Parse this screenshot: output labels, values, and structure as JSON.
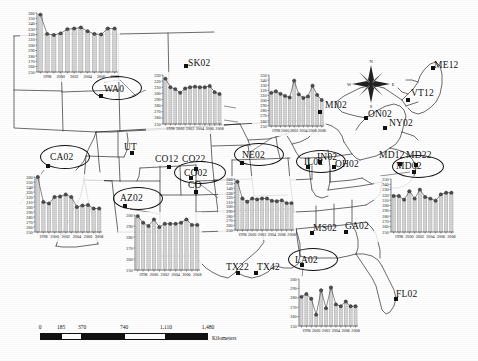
{
  "figure": {
    "kind": "map-with-inset-timeseries",
    "region": "North America (conterminous United States and southern Canada)",
    "axis": {
      "y_ticks": [
        "360",
        "350",
        "340",
        "330",
        "320",
        "310",
        "300",
        "290",
        "280",
        "270",
        "260",
        "250"
      ],
      "y_min": 250,
      "y_max": 360,
      "x_ticks": [
        "1998",
        "2000",
        "2002",
        "2004",
        "2006",
        "2008"
      ],
      "x_min": 1997,
      "x_max": 2009
    },
    "colors": {
      "bar_fill": "#d4d4d4",
      "bar_stroke": "#9a9a9a",
      "marker": "#4d4d4d",
      "line": "#3a3a3a",
      "map_line": "#2b2b2b",
      "text": "#111111"
    }
  },
  "compass": {
    "name": "compass-rose",
    "north": "N",
    "east": "E",
    "south": "S",
    "west": "W"
  },
  "scale_bar": {
    "ticks": [
      "0",
      "185",
      "370",
      "740",
      "1,110",
      "1,480"
    ],
    "unit_label": "Kilometers"
  },
  "site_labels": [
    {
      "id": "WA0",
      "text": "WA0",
      "x": 104,
      "y": 84,
      "dot_x": 99,
      "dot_y": 94,
      "circled": true,
      "ellipse": {
        "x": 92,
        "y": 76,
        "w": 48,
        "h": 22
      }
    },
    {
      "id": "SK02",
      "text": "SK02",
      "x": 188,
      "y": 58,
      "dot_x": 184,
      "dot_y": 64,
      "circled": false
    },
    {
      "id": "CA02",
      "text": "CA02",
      "x": 50,
      "y": 152,
      "dot_x": 46,
      "dot_y": 164,
      "circled": true,
      "ellipse": {
        "x": 40,
        "y": 145,
        "w": 48,
        "h": 22
      }
    },
    {
      "id": "UT",
      "text": "UT",
      "x": 124,
      "y": 142,
      "dot_x": 130,
      "dot_y": 151,
      "circled": false
    },
    {
      "id": "CO12",
      "text": "CO12",
      "x": 155,
      "y": 154,
      "dot_x": 167,
      "dot_y": 165,
      "circled": false
    },
    {
      "id": "CO22",
      "text": "CO22",
      "x": 182,
      "y": 154,
      "dot_x": 194,
      "dot_y": 167,
      "circled": false
    },
    {
      "id": "CO02",
      "text": "CO02",
      "x": 184,
      "y": 168,
      "dot_x": 189,
      "dot_y": 176,
      "circled": true,
      "ellipse": {
        "x": 174,
        "y": 161,
        "w": 50,
        "h": 21
      }
    },
    {
      "id": "CO",
      "text": "CO",
      "x": 188,
      "y": 180,
      "dot_x": 194,
      "dot_y": 190,
      "circled": false
    },
    {
      "id": "AZ02",
      "text": "AZ02",
      "x": 120,
      "y": 193,
      "dot_x": 123,
      "dot_y": 204,
      "circled": true,
      "ellipse": {
        "x": 113,
        "y": 187,
        "w": 48,
        "h": 21
      }
    },
    {
      "id": "NE02",
      "text": "NE02",
      "x": 242,
      "y": 150,
      "dot_x": 240,
      "dot_y": 161,
      "circled": true,
      "ellipse": {
        "x": 234,
        "y": 143,
        "w": 48,
        "h": 21
      }
    },
    {
      "id": "MI02",
      "text": "MI02",
      "x": 325,
      "y": 100,
      "dot_x": 318,
      "dot_y": 110,
      "circled": false
    },
    {
      "id": "ON02",
      "text": "ON02",
      "x": 368,
      "y": 109,
      "dot_x": 364,
      "dot_y": 116,
      "circled": false
    },
    {
      "id": "NY02",
      "text": "NY02",
      "x": 389,
      "y": 118,
      "dot_x": 383,
      "dot_y": 126,
      "circled": false
    },
    {
      "id": "VT12",
      "text": "VT12",
      "x": 411,
      "y": 88,
      "dot_x": 406,
      "dot_y": 98,
      "circled": false
    },
    {
      "id": "ME12",
      "text": "ME12",
      "x": 434,
      "y": 60,
      "dot_x": 431,
      "dot_y": 66,
      "circled": false
    },
    {
      "id": "IL02",
      "text": "IL02",
      "x": 304,
      "y": 157,
      "dot_x": 306,
      "dot_y": 165,
      "circled": true,
      "ellipse": {
        "x": 296,
        "y": 150,
        "w": 48,
        "h": 21
      }
    },
    {
      "id": "IN02",
      "text": "IN02",
      "x": 317,
      "y": 152,
      "dot_x": 318,
      "dot_y": 160,
      "circled": false
    },
    {
      "id": "OH02",
      "text": "OH02",
      "x": 335,
      "y": 159,
      "dot_x": 332,
      "dot_y": 165,
      "circled": false
    },
    {
      "id": "MD12",
      "text": "MD12",
      "x": 379,
      "y": 150,
      "dot_x": 398,
      "dot_y": 162,
      "circled": false
    },
    {
      "id": "MD22",
      "text": "MD22",
      "x": 406,
      "y": 150,
      "dot_x": 414,
      "dot_y": 163,
      "circled": false
    },
    {
      "id": "MD02",
      "text": "MD02",
      "x": 396,
      "y": 161,
      "dot_x": 412,
      "dot_y": 170,
      "circled": true,
      "ellipse": {
        "x": 392,
        "y": 155,
        "w": 50,
        "h": 21
      }
    },
    {
      "id": "MS02",
      "text": "MS02",
      "x": 313,
      "y": 223,
      "dot_x": 310,
      "dot_y": 231,
      "circled": false
    },
    {
      "id": "GA02",
      "text": "GA02",
      "x": 345,
      "y": 221,
      "dot_x": 344,
      "dot_y": 230,
      "circled": false
    },
    {
      "id": "LA02",
      "text": "LA02",
      "x": 295,
      "y": 255,
      "dot_x": 300,
      "dot_y": 263,
      "circled": true,
      "ellipse": {
        "x": 288,
        "y": 248,
        "w": 48,
        "h": 21
      }
    },
    {
      "id": "TX22",
      "text": "TX22",
      "x": 226,
      "y": 262,
      "dot_x": 236,
      "dot_y": 271,
      "circled": false
    },
    {
      "id": "TX42",
      "text": "TX42",
      "x": 257,
      "y": 262,
      "dot_x": 254,
      "dot_y": 271,
      "circled": false
    },
    {
      "id": "FL02",
      "text": "FL02",
      "x": 396,
      "y": 289,
      "dot_x": 394,
      "dot_y": 297,
      "circled": false
    }
  ],
  "chart_data": [
    {
      "id": "chart-wa",
      "site": "WA0",
      "type": "bar",
      "title": "",
      "xlabel": "",
      "ylabel": "",
      "categories": [
        "1997",
        "1998",
        "1999",
        "2000",
        "2001",
        "2002",
        "2003",
        "2004",
        "2005",
        "2006",
        "2007",
        "2008"
      ],
      "values": [
        357,
        321,
        319,
        322,
        330,
        331,
        333,
        326,
        321,
        320,
        331,
        331
      ],
      "ylim": [
        250,
        360
      ],
      "grid": false,
      "legend": "none"
    },
    {
      "id": "chart-ut",
      "site": "UT",
      "type": "bar",
      "title": "",
      "xlabel": "",
      "ylabel": "",
      "categories": [
        "1997",
        "1998",
        "1999",
        "2000",
        "2001",
        "2002",
        "2003",
        "2004",
        "2005",
        "2006",
        "2007",
        "2008"
      ],
      "values": [
        324,
        310,
        307,
        301,
        308,
        310,
        311,
        310,
        310,
        312,
        302,
        299
      ],
      "ylim": [
        250,
        330
      ],
      "grid": false,
      "legend": "none"
    },
    {
      "id": "chart-ca",
      "site": "CA02",
      "type": "bar",
      "title": "",
      "xlabel": "",
      "ylabel": "",
      "categories": [
        "1997",
        "1998",
        "1999",
        "2000",
        "2001",
        "2002",
        "2003",
        "2004",
        "2005",
        "2006",
        "2007",
        "2008"
      ],
      "values": [
        360,
        310,
        307,
        320,
        321,
        325,
        320,
        300,
        303,
        304,
        297,
        297
      ],
      "ylim": [
        250,
        360
      ],
      "grid": false,
      "legend": "none"
    },
    {
      "id": "chart-az",
      "site": "AZ02",
      "type": "bar",
      "title": "",
      "xlabel": "",
      "ylabel": "",
      "categories": [
        "1997",
        "1998",
        "1999",
        "2000",
        "2001",
        "2002",
        "2003",
        "2004",
        "2005",
        "2006",
        "2007",
        "2008"
      ],
      "values": [
        299,
        293,
        290,
        296,
        289,
        292,
        292,
        292,
        293,
        296,
        291,
        291
      ],
      "ylim": [
        250,
        300
      ],
      "grid": false,
      "legend": "none"
    },
    {
      "id": "chart-co",
      "site": "CO02",
      "type": "bar",
      "title": "",
      "xlabel": "",
      "ylabel": "",
      "categories": [
        "1997",
        "1998",
        "1999",
        "2000",
        "2001",
        "2002",
        "2003",
        "2004",
        "2005",
        "2006",
        "2007",
        "2008"
      ],
      "values": [
        354,
        318,
        311,
        318,
        316,
        318,
        318,
        313,
        312,
        314,
        308,
        308
      ],
      "ylim": [
        250,
        360
      ],
      "grid": false,
      "legend": "none"
    },
    {
      "id": "chart-ne",
      "site": "NE02",
      "type": "bar",
      "title": "",
      "xlabel": "",
      "ylabel": "",
      "categories": [
        "1997",
        "1998",
        "1999",
        "2000",
        "2001",
        "2002",
        "2003",
        "2004",
        "2005",
        "2006",
        "2007",
        "2008"
      ],
      "values": [
        315,
        318,
        313,
        309,
        306,
        339,
        312,
        305,
        308,
        329,
        311,
        301
      ],
      "ylim": [
        250,
        350
      ],
      "grid": false,
      "legend": "none"
    },
    {
      "id": "chart-md",
      "site": "MD02",
      "type": "bar",
      "title": "",
      "xlabel": "",
      "ylabel": "",
      "categories": [
        "1997",
        "1998",
        "1999",
        "2000",
        "2001",
        "2002",
        "2003",
        "2004",
        "2005",
        "2006",
        "2007",
        "2008"
      ],
      "values": [
        318,
        318,
        311,
        327,
        313,
        330,
        316,
        313,
        309,
        321,
        324,
        324
      ],
      "ylim": [
        250,
        350
      ],
      "grid": false,
      "legend": "none"
    },
    {
      "id": "chart-la",
      "site": "LA02",
      "type": "bar",
      "title": "",
      "xlabel": "",
      "ylabel": "",
      "categories": [
        "1997",
        "1998",
        "1999",
        "2000",
        "2001",
        "2002",
        "2003",
        "2004",
        "2005",
        "2006",
        "2007",
        "2008"
      ],
      "values": [
        281,
        284,
        279,
        262,
        288,
        269,
        291,
        273,
        271,
        276,
        271,
        271
      ],
      "ylim": [
        250,
        300
      ],
      "grid": false,
      "legend": "none"
    },
    {
      "id": "chart-tx",
      "site": "TX42",
      "type": "bar",
      "title": "",
      "xlabel": "",
      "ylabel": "",
      "categories": [
        "1997",
        "1998",
        "1999",
        "2000",
        "2001",
        "2002",
        "2003",
        "2004",
        "2005",
        "2006",
        "2007",
        "2008"
      ],
      "values": [
        340,
        316,
        311,
        306,
        309,
        311,
        310,
        310,
        304,
        306,
        302,
        302
      ],
      "ylim": [
        250,
        360
      ],
      "grid": false,
      "legend": "none"
    }
  ],
  "chart_placement": [
    {
      "ref": "chart-wa",
      "x": 20,
      "y": 10,
      "w": 100,
      "h": 72,
      "yticks": 12,
      "leader": [
        [
          118,
          78
        ],
        [
          135,
          96
        ]
      ]
    },
    {
      "ref": "chart-ut",
      "x": 146,
      "y": 72,
      "w": 78,
      "h": 62,
      "yticks": 9,
      "leader": [
        [
          146,
          88
        ],
        [
          131,
          95
        ]
      ]
    },
    {
      "ref": "chart-ca",
      "x": 18,
      "y": 174,
      "w": 86,
      "h": 68,
      "yticks": 12,
      "leader": [
        [
          18,
          200
        ],
        [
          46,
          168
        ]
      ]
    },
    {
      "ref": "chart-az",
      "x": 118,
      "y": 212,
      "w": 84,
      "h": 68,
      "yticks": 11,
      "leader": [
        [
          160,
          212
        ],
        [
          128,
          208
        ]
      ]
    },
    {
      "ref": "chart-co",
      "x": 218,
      "y": 176,
      "w": 78,
      "h": 64,
      "yticks": 12,
      "leader": [
        [
          218,
          196
        ],
        [
          198,
          182
        ]
      ]
    },
    {
      "ref": "chart-ne",
      "x": 252,
      "y": 72,
      "w": 74,
      "h": 64,
      "yticks": 11,
      "leader": [
        [
          270,
          136
        ],
        [
          248,
          152
        ]
      ]
    },
    {
      "ref": "chart-md",
      "x": 374,
      "y": 176,
      "w": 82,
      "h": 66,
      "yticks": 11,
      "leader": [
        [
          382,
          176
        ],
        [
          412,
          172
        ]
      ]
    },
    {
      "ref": "chart-la",
      "x": 282,
      "y": 276,
      "w": 78,
      "h": 60,
      "yticks": 7,
      "leader": [
        [
          300,
          276
        ],
        [
          302,
          266
        ]
      ]
    },
    {
      "ref": "chart-tx",
      "x": 268,
      "y": 122,
      "w": 0,
      "h": 0,
      "yticks": 0,
      "leader": null
    }
  ]
}
